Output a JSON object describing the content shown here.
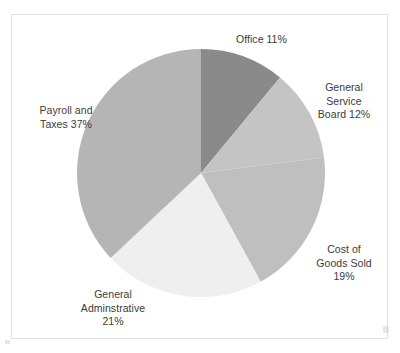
{
  "chart_data": {
    "type": "pie",
    "title": "",
    "subtitle": "",
    "legend_position": "none",
    "labels_position": "outside",
    "grid": false,
    "units": "percent",
    "total": 100,
    "start_angle_deg": 0,
    "direction": "clockwise",
    "categories": [
      "Office",
      "General Service Board",
      "Cost of Goods Sold",
      "General Adminstrative",
      "Payroll and Taxes"
    ],
    "values": [
      11,
      12,
      19,
      21,
      37
    ],
    "colors": [
      "#8a8a8a",
      "#c4c4c4",
      "#bfbfbf",
      "#efefef",
      "#b5b5b5"
    ],
    "slices": [
      {
        "name": "Office",
        "value": 11,
        "label_lines": [
          "Office 11%"
        ],
        "color": "#8a8a8a",
        "start_deg": 0,
        "end_deg": 39.6
      },
      {
        "name": "General Service Board",
        "value": 12,
        "label_lines": [
          "General",
          "Service",
          "Board 12%"
        ],
        "color": "#c4c4c4",
        "start_deg": 39.6,
        "end_deg": 82.8
      },
      {
        "name": "Cost of Goods Sold",
        "value": 19,
        "label_lines": [
          "Cost of",
          "Goods Sold",
          "19%"
        ],
        "color": "#bfbfbf",
        "start_deg": 82.8,
        "end_deg": 151.2
      },
      {
        "name": "General Adminstrative",
        "value": 21,
        "label_lines": [
          "General",
          "Adminstrative",
          "21%"
        ],
        "color": "#efefef",
        "start_deg": 151.2,
        "end_deg": 226.8
      },
      {
        "name": "Payroll and Taxes",
        "value": 37,
        "label_lines": [
          "Payroll and",
          "Taxes 37%"
        ],
        "color": "#b5b5b5",
        "start_deg": 226.8,
        "end_deg": 360
      }
    ]
  },
  "labels": {
    "office": "Office 11%",
    "general_service_board": "General\nService\nBoard 12%",
    "cost_of_goods_sold": "Cost of\nGoods Sold\n19%",
    "general_adminstrative": "General\nAdminstrative\n21%",
    "payroll_and_taxes": "Payroll and\nTaxes 37%"
  },
  "style": {
    "background": "#ffffff",
    "frame_border": "#e3e3e3",
    "label_text": "#3b3b3b"
  },
  "geometry": {
    "center_x": 201,
    "center_y": 173,
    "radius": 124
  }
}
